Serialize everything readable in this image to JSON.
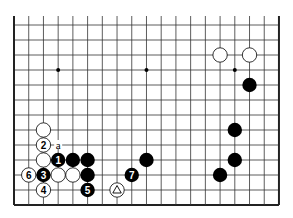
{
  "diagram": {
    "type": "go-board-partial",
    "board_size": 19,
    "visible_rows_from_bottom": 13,
    "visible_cols": 19,
    "edges": [
      "left",
      "right",
      "bottom"
    ],
    "colors": {
      "black": "#000000",
      "white": "#ffffff",
      "line": "#333333",
      "edge": "#222222"
    },
    "star_points": [
      {
        "col": 3,
        "row": 9
      },
      {
        "col": 9,
        "row": 9
      },
      {
        "col": 15,
        "row": 9
      }
    ],
    "stones": [
      {
        "color": "white",
        "col": 14,
        "row": 10,
        "label": ""
      },
      {
        "color": "white",
        "col": 16,
        "row": 10,
        "label": ""
      },
      {
        "color": "black",
        "col": 16,
        "row": 8,
        "label": ""
      },
      {
        "color": "black",
        "col": 15,
        "row": 5,
        "label": ""
      },
      {
        "color": "black",
        "col": 15,
        "row": 3,
        "label": ""
      },
      {
        "color": "black",
        "col": 14,
        "row": 2,
        "label": ""
      },
      {
        "color": "black",
        "col": 9,
        "row": 3,
        "label": ""
      },
      {
        "color": "white",
        "col": 2,
        "row": 5,
        "label": ""
      },
      {
        "color": "white",
        "col": 2,
        "row": 4,
        "label": "2"
      },
      {
        "color": "white",
        "col": 2,
        "row": 3,
        "label": ""
      },
      {
        "color": "black",
        "col": 3,
        "row": 3,
        "label": "1"
      },
      {
        "color": "black",
        "col": 4,
        "row": 3,
        "label": ""
      },
      {
        "color": "black",
        "col": 5,
        "row": 3,
        "label": ""
      },
      {
        "color": "white",
        "col": 1,
        "row": 2,
        "label": "6"
      },
      {
        "color": "black",
        "col": 2,
        "row": 2,
        "label": "3"
      },
      {
        "color": "white",
        "col": 3,
        "row": 2,
        "label": ""
      },
      {
        "color": "white",
        "col": 4,
        "row": 2,
        "label": ""
      },
      {
        "color": "black",
        "col": 5,
        "row": 2,
        "label": ""
      },
      {
        "color": "white",
        "col": 2,
        "row": 1,
        "label": "4"
      },
      {
        "color": "black",
        "col": 5,
        "row": 1,
        "label": "5"
      },
      {
        "color": "white",
        "col": 7,
        "row": 1,
        "label": "triangle"
      },
      {
        "color": "black",
        "col": 8,
        "row": 2,
        "label": "7"
      }
    ],
    "point_labels": [
      {
        "col": 3,
        "row": 4,
        "text": "a"
      }
    ]
  }
}
